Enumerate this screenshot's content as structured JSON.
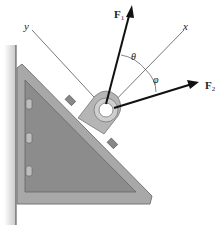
{
  "figure": {
    "labels": {
      "force1": "F",
      "force1_sub": "1",
      "force2": "F",
      "force2_sub": "2",
      "axis_x": "x",
      "axis_y": "y",
      "angle_theta": "θ",
      "angle_phi": "φ"
    },
    "colors": {
      "bracket_fill": "#8a8a8a",
      "bracket_edge": "#b0b0b0",
      "bracket_dark": "#6d6d6d",
      "wall": "#cfcfcf",
      "arrow": "#111111",
      "axis_line": "#555555"
    }
  }
}
